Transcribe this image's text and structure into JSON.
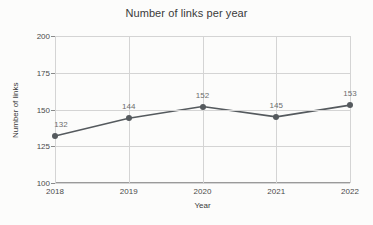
{
  "chart_data": {
    "type": "line",
    "title": "Number of links per year",
    "xlabel": "Year",
    "ylabel": "Number of links",
    "categories": [
      "2018",
      "2019",
      "2020",
      "2021",
      "2022"
    ],
    "values": [
      132,
      144,
      152,
      145,
      153
    ],
    "point_labels": [
      "132",
      "144",
      "152",
      "145",
      "153"
    ],
    "ylim": [
      100,
      200
    ],
    "yticks": [
      100,
      125,
      150,
      175,
      200
    ],
    "ytick_labels": [
      "100",
      "125",
      "150",
      "175",
      "200"
    ],
    "grid": true,
    "legend": false,
    "series": [
      {
        "name": "Number of links",
        "values": [
          132,
          144,
          152,
          145,
          153
        ]
      }
    ],
    "colors": {
      "line": "#555a5e",
      "marker": "#555a5e",
      "grid": "#d4d4d4",
      "axis": "#9a9a9a",
      "text": "#3a3a3a",
      "label": "#6d6d6d",
      "background": "#fcfcfb"
    }
  }
}
